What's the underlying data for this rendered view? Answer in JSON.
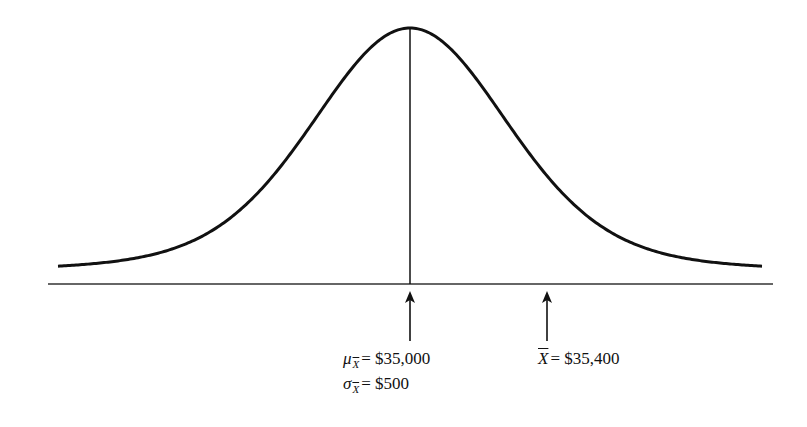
{
  "figure": {
    "type": "normal_sampling_distribution",
    "curve": {
      "peak_x": 410,
      "peak_y": 28,
      "tail_y": 272,
      "x_start": 58,
      "x_end": 763,
      "stroke": "#111111"
    },
    "baseline": {
      "y": 284,
      "x_start": 48,
      "x_end": 773
    },
    "center_line": {
      "x": 410
    },
    "arrows": [
      {
        "name": "mean-arrow",
        "x": 410,
        "tip_y": 291,
        "tail_y": 341
      },
      {
        "name": "sample-mean-arrow",
        "x": 547,
        "tip_y": 291,
        "tail_y": 341
      }
    ]
  },
  "labels": {
    "mu": {
      "symbol": "μ",
      "sub": "X",
      "eq": "= $35,000"
    },
    "sigma": {
      "symbol": "σ",
      "sub": "X",
      "eq": "= $500"
    },
    "xbar": {
      "symbol": "X",
      "eq": "= $35,400"
    }
  }
}
